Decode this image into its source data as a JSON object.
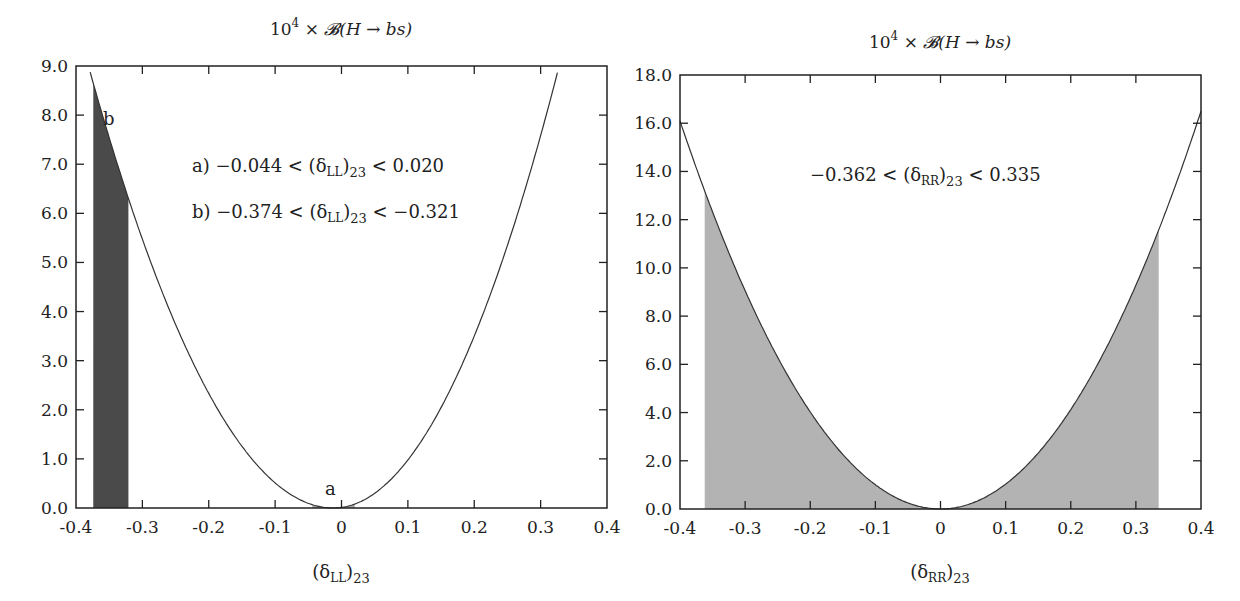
{
  "chart_data": [
    {
      "type": "line",
      "title": "10⁴ × 𝓑(H → bs)",
      "xlabel": "(δ_LL)₂₃",
      "ylabel": "",
      "xlim": [
        -0.4,
        0.4
      ],
      "ylim": [
        0.0,
        9.0
      ],
      "xticks": [
        -0.4,
        -0.3,
        -0.2,
        -0.1,
        0,
        0.1,
        0.2,
        0.3,
        0.4
      ],
      "xtick_labels": [
        "-0.4",
        "-0.3",
        "-0.2",
        "-0.1",
        "0",
        "0.1",
        "0.2",
        "0.3",
        "0.4"
      ],
      "yticks": [
        0,
        1,
        2,
        3,
        4,
        5,
        6,
        7,
        8,
        9
      ],
      "ytick_labels": [
        "0.0",
        "1.0",
        "2.0",
        "3.0",
        "4.0",
        "5.0",
        "6.0",
        "7.0",
        "8.0",
        "9.0"
      ],
      "grid": false,
      "curve": {
        "description": "parabola-like branching ratio vs (δ_LL)23",
        "minimum_x": -0.012,
        "left_coefficient": 66,
        "right_coefficient": 77.9,
        "x": [
          -0.38,
          -0.374,
          -0.35,
          -0.321,
          -0.3,
          -0.25,
          -0.2,
          -0.15,
          -0.1,
          -0.05,
          -0.012,
          0.0,
          0.05,
          0.1,
          0.15,
          0.2,
          0.25,
          0.3,
          0.328
        ],
        "y": [
          9.0,
          8.7,
          7.6,
          6.0,
          5.4,
          3.9,
          2.6,
          1.5,
          0.6,
          0.1,
          0.0,
          0.01,
          0.3,
          1.0,
          2.0,
          3.4,
          5.1,
          7.1,
          9.0
        ]
      },
      "shaded_regions": [
        {
          "label": "a",
          "x_min": -0.044,
          "x_max": 0.02,
          "color": "#aaaaaa"
        },
        {
          "label": "b",
          "x_min": -0.374,
          "x_max": -0.321,
          "color": "#4a4a4a"
        }
      ],
      "annotations": [
        {
          "text": "a) −0.044 < (δ_LL)₂₃ < 0.020"
        },
        {
          "text": "b) −0.374 < (δ_LL)₂₃ < −0.321"
        },
        {
          "text": "a",
          "x": -0.01,
          "y": 0.4
        },
        {
          "text": "b",
          "x": -0.352,
          "y": 8.0
        }
      ]
    },
    {
      "type": "line",
      "title": "10⁴ × 𝓑(H → bs)",
      "xlabel": "(δ_RR)₂₃",
      "ylabel": "",
      "xlim": [
        -0.4,
        0.4
      ],
      "ylim": [
        0.0,
        18.0
      ],
      "xticks": [
        -0.4,
        -0.3,
        -0.2,
        -0.1,
        0,
        0.1,
        0.2,
        0.3,
        0.4
      ],
      "xtick_labels": [
        "-0.4",
        "-0.3",
        "-0.2",
        "-0.1",
        "0",
        "0.1",
        "0.2",
        "0.3",
        "0.4"
      ],
      "yticks": [
        0,
        2,
        4,
        6,
        8,
        10,
        12,
        14,
        16,
        18
      ],
      "ytick_labels": [
        "0.0",
        "2.0",
        "4.0",
        "6.0",
        "8.0",
        "10.0",
        "12.0",
        "14.0",
        "16.0",
        "18.0"
      ],
      "grid": false,
      "curve": {
        "description": "parabola-like branching ratio vs (δ_RR)23",
        "minimum_x": 0.0,
        "left_coefficient": 100.6,
        "right_coefficient": 103.1,
        "x": [
          -0.4,
          -0.362,
          -0.3,
          -0.2,
          -0.1,
          0.0,
          0.1,
          0.2,
          0.3,
          0.335,
          0.4
        ],
        "y": [
          16.1,
          13.2,
          9.1,
          4.0,
          1.0,
          0.0,
          1.0,
          4.1,
          9.3,
          11.6,
          16.5
        ]
      },
      "shaded_regions": [
        {
          "label": "",
          "x_min": -0.362,
          "x_max": 0.335,
          "color": "#b3b3b3"
        }
      ],
      "annotations": [
        {
          "text": "−0.362 < (δ_RR)₂₃ < 0.335"
        }
      ]
    }
  ],
  "plots": [
    {
      "title_parts": {
        "base": "10",
        "exp": "4",
        "rest": " × ",
        "B": "𝓑",
        "args": "(H → bs)"
      },
      "xlabel_parts": {
        "open": "(δ",
        "sub": "LL",
        "close": ")",
        "sub2": "23"
      },
      "annot_a": {
        "prefix": "a) −0.044 < (δ",
        "sub": "LL",
        "mid": ")",
        "sub2": "23",
        "suffix": " < 0.020"
      },
      "annot_b": {
        "prefix": "b) −0.374 < (δ",
        "sub": "LL",
        "mid": ")",
        "sub2": "23",
        "suffix": " < −0.321"
      },
      "label_a": "a",
      "label_b": "b"
    },
    {
      "title_parts": {
        "base": "10",
        "exp": "4",
        "rest": " × ",
        "B": "𝓑",
        "args": "(H → bs)"
      },
      "xlabel_parts": {
        "open": "(δ",
        "sub": "RR",
        "close": ")",
        "sub2": "23"
      },
      "annot": {
        "prefix": "−0.362 < (δ",
        "sub": "RR",
        "mid": ")",
        "sub2": "23",
        "suffix": " < 0.335"
      }
    }
  ]
}
